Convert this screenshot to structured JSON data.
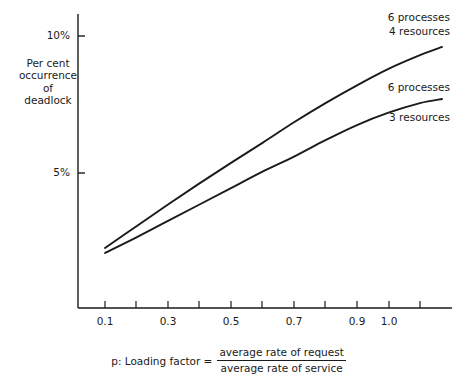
{
  "axes": {
    "y_label_lines": [
      "Per cent",
      "occurrence",
      "of",
      "deadlock"
    ],
    "y_ticks": [
      {
        "value": 10,
        "label": "10%",
        "y_px": 36
      },
      {
        "value": 5,
        "label": "5%",
        "y_px": 173
      }
    ],
    "x_ticks": [
      {
        "value": 0.1,
        "label": "0.1",
        "x_px": 105
      },
      {
        "value": 0.3,
        "label": "0.3",
        "x_px": 168
      },
      {
        "value": 0.5,
        "label": "0.5",
        "x_px": 231
      },
      {
        "value": 0.7,
        "label": "0.7",
        "x_px": 294
      },
      {
        "value": 0.9,
        "label": "0.9",
        "x_px": 357
      },
      {
        "value": 1.0,
        "label": "1.0",
        "x_px": 389
      }
    ],
    "x_minor_tick_px": [
      136,
      199,
      262,
      325,
      389,
      420
    ],
    "x_axis_y_px": 308,
    "y_axis_x_px": 78,
    "axis_color": "#1a1a1a"
  },
  "annotations": {
    "upper": {
      "line1": "6 processes",
      "line2": "4 resources"
    },
    "lower": {
      "line1": "6 processes",
      "line2": "3 resources"
    }
  },
  "caption": {
    "lead": "p: Loading factor =",
    "numerator": "average rate of request",
    "denominator": "average rate of service"
  },
  "chart_data": {
    "type": "line",
    "title": "",
    "xlabel": "p: Loading factor = average rate of request / average rate of service",
    "ylabel": "Per cent occurrence of deadlock",
    "xlim": [
      0.06,
      1.17
    ],
    "ylim": [
      0,
      11.0
    ],
    "grid": false,
    "legend_position": "inline-right-annotations",
    "x": [
      0.1,
      0.2,
      0.3,
      0.4,
      0.5,
      0.6,
      0.7,
      0.8,
      0.9,
      1.0,
      1.1,
      1.17
    ],
    "series": [
      {
        "name": "6 processes 4 resources",
        "color": "#1a1a1a",
        "values": [
          2.26,
          3.06,
          3.85,
          4.62,
          5.37,
          6.1,
          6.85,
          7.55,
          8.2,
          8.8,
          9.3,
          9.6
        ]
      },
      {
        "name": "6 processes 3 resources",
        "color": "#1a1a1a",
        "values": [
          2.08,
          2.65,
          3.25,
          3.85,
          4.45,
          5.05,
          5.6,
          6.2,
          6.75,
          7.2,
          7.55,
          7.7
        ]
      }
    ]
  }
}
